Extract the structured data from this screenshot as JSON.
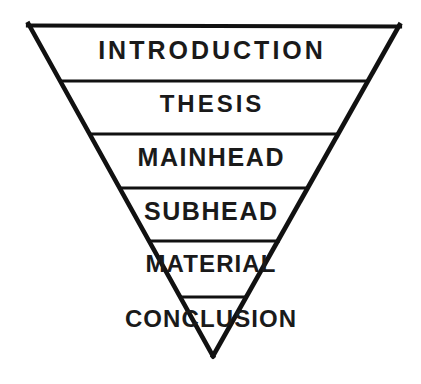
{
  "diagram": {
    "type": "inverted-pyramid",
    "background_color": "#ffffff",
    "stroke_color": "#111111",
    "text_color": "#1a1a1a",
    "outline": {
      "top_left": [
        28,
        24
      ],
      "top_right": [
        400,
        25
      ],
      "bottom_tip": [
        213,
        355
      ]
    },
    "bands": [
      {
        "label": "INTRODUCTION",
        "order": 1,
        "divider_y": 81
      },
      {
        "label": "THESIS",
        "order": 2,
        "divider_y": 134
      },
      {
        "label": "MAINHEAD",
        "order": 3,
        "divider_y": 188
      },
      {
        "label": "SUBHEAD",
        "order": 4,
        "divider_y": 241
      },
      {
        "label": "MATERIAL",
        "order": 5,
        "divider_y": 297
      },
      {
        "label": "CONCLUSION",
        "order": 6,
        "divider_y": null
      }
    ]
  }
}
